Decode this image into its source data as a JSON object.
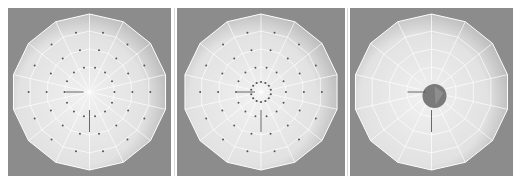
{
  "figure": {
    "panels": [
      {
        "id": "panel-1",
        "state": "mesh-with-vertices",
        "x": 8,
        "width": 163,
        "center_vertices": false,
        "hole": false
      },
      {
        "id": "panel-2",
        "state": "mesh-with-inner-ring",
        "x": 177,
        "width": 168,
        "center_vertices": true,
        "hole": false
      },
      {
        "id": "panel-3",
        "state": "mesh-with-center-hole",
        "x": 350,
        "width": 163,
        "center_vertices": false,
        "hole": true
      }
    ],
    "colors": {
      "background": "#8c8c8c",
      "dome_light": "#f0f0f0",
      "dome_dark": "#b5b5b5",
      "wire": "#ffffff",
      "vertex": "#555555",
      "hole": "#7a7a7a"
    },
    "segments": 14,
    "rings": 4
  }
}
